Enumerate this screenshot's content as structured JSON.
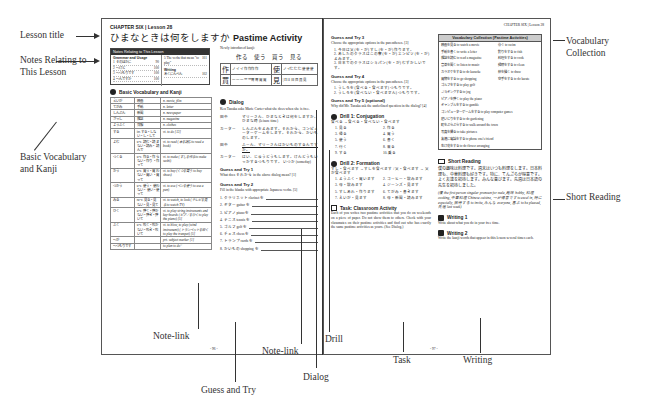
{
  "left_page": {
    "chapter_label": "CHAPTER SIX | Lesson 28",
    "lesson_title_jp": "ひまなときは何をしますか",
    "lesson_title_en": "Pastime Activity",
    "notes_box": {
      "header": "Notes Relating to This Lesson",
      "grammar_heading": "Grammar and Usage",
      "grammar_items": [
        {
          "label": "1 そのほかに",
          "page": "90"
        },
        {
          "label": "2 〜けど",
          "page": "100"
        },
        {
          "label": "3 〜つもりです",
          "page": "100"
        },
        {
          "label": "4 〜んですか",
          "page": "100"
        }
      ],
      "right_items": [
        {
          "label": "5 The verbs that mean \"to play\"",
          "page": "101"
        }
      ],
      "writing_heading": "Writing",
      "writing_items": [
        {
          "label": "あくにんべん",
          "page": "102"
        }
      ]
    },
    "vocab_heading": "Basic Vocabulary and Kanji",
    "vocab_rows": [
      [
        "えいが",
        "映画",
        "n. movie, film"
      ],
      [
        "てがみ",
        "手紙",
        "n. letter"
      ],
      [
        "しんぶん",
        "新聞",
        "n. newspaper"
      ],
      [
        "ざっし",
        "雑誌",
        "n. magazine"
      ],
      [
        "ようふく",
        "洋服",
        "n. clothes"
      ],
      [
        "する",
        "irr. する・しな い・し・して",
        "vt. to do [13]"
      ],
      [
        "よむ",
        "u-v. 読む・読 まない・読み・ 読んで",
        "vt. to read (本を読む to read a book)"
      ],
      [
        "つくる",
        "u-v. 作る・作 らない・作り ・作って",
        "vt. to make (すしを作る to make sushi)"
      ],
      [
        "かう",
        "u-v. 買う・買 わない・買い ・買って",
        "vt. to buy (くつを買う to buy shoes)"
      ],
      [
        "つかう",
        "u-v. 使う・ 使わない・ 使い・使って",
        "vt. to use (ペンを使う to use a pen)"
      ],
      [
        "みる",
        "ru-v. 見る・見 ない・見・見て",
        "vt. to watch, to look (テレビを見る to watch TV)"
      ],
      [
        "ひく",
        "u-v. 弾く・弾か ない・弾き・弾 いて",
        "vt. to play string instruments and key-boards (ピアノをひく to play the piano) [5]"
      ],
      [
        "ふく",
        "u-v. 吹く・吹か ない・吹き・吹 いて",
        "vt. to blow, to play (wind instrument) (トランペットを吹く to play the trumpet) [5]"
      ],
      [
        "〜が",
        "",
        "prt. subject marker [1]"
      ],
      [
        "〜つもりです",
        "",
        "to plan to do~"
      ]
    ],
    "new_kanji_label": "Newly introduced kanji:",
    "new_kanji_line": "作る　使う　買う　見る",
    "kanji_grid": [
      {
        "kanji": "作",
        "strokes": "ノ イ イ 作 作 作 作"
      },
      {
        "kanji": "使",
        "strokes": "ノ イ 仁 仁 仁 使 使 使"
      },
      {
        "kanji": "買",
        "strokes": "一 一 一 罒 罒 胃 胃 買 買"
      },
      {
        "kanji": "見",
        "strokes": "| Π Ħ 日 目 貝 見"
      }
    ],
    "dialog_heading": "Dialog",
    "dialog_intro": "Ken Tanaka asks Marie Carter what she does when she is free.",
    "dialog_lines": [
      {
        "speaker": "田中",
        "text": "マリーさん、ひまなときは何をしますか。 ひまな時 (leisure time)"
      },
      {
        "speaker": "カーター",
        "text": "しんぶんをよみます。それから、コンピューターゲームをします。それから、かいものします。"
      },
      {
        "speaker": "田中",
        "text": "ふーん、マリーさんはかいものするんですか。"
      },
      {
        "speaker": "カーター",
        "text": "はい、じゅうどうもします。けんどうもいっかするつもりです。 いつか (someday)"
      }
    ],
    "guess1_heading": "Guess and Try 1",
    "guess1_text": "What does それから in the above dialog mean? [1]",
    "guess2_heading": "Guess and Try 2",
    "guess2_text": "Fill in the blanks with appropriate Japanese verbs. [5]",
    "guess2_items": [
      "1. クラリネット clarinet を",
      "2. ギター guitar を",
      "3. ピアノ piano を",
      "4. テニス tennis を",
      "5. ゴルフ golf を",
      "6. チェス chess を",
      "7. トランプ cards を",
      "8. かいもの shopping を"
    ],
    "page_number": "- 96 -"
  },
  "right_page": {
    "header": "CHAPTER SIX | Lesson 28",
    "guess3_heading": "Guess and Try 3",
    "guess3_text": "Choose the appropriate options in the parentheses. [3]",
    "guess3_items": [
      "1. 今日は父 (を・が) すし (を・が) 作ります。",
      "2. あしたのクラスはこの寮 (を・が) エンピツ (を・が) よみます。",
      "3. 日本でのクラスはショパン (を・が) むずかしいです。"
    ],
    "guess4_heading": "Guess and Try 4",
    "guess4_text": "Choose the appropriate options in the parentheses. [3]",
    "guess4_items": [
      "1. うしろを (食べる・食べます) つもりです。",
      "2. うしろを (食べない・食べません) つもりです。"
    ],
    "guess5_heading": "Guess and Try 5 (optional)",
    "guess5_text": "Why did Mr. Tanaka ask the underlined question in the dialog? [4]",
    "drill1_heading": "Drill 1: Conjugation",
    "drill1_example": "食べる → 食べる・食べない・食べます",
    "drill1_items": [
      "1. 見る",
      "2. 作る",
      "3. 帰る",
      "4. 買う",
      "5. 使う",
      "6. 書く",
      "7. 行く",
      "8. 来る",
      "9. する",
      "10. 乗る"
    ],
    "drill2_heading": "Drill 2: Formation",
    "drill2_example": "すし・食べます → すしを食べます / 父・食べます → 父が食べます",
    "drill2_items": [
      "1. ようふく・買います",
      "2. コーヒー・飲みます",
      "3. 母・飲みます",
      "4. ジーンズ・見ます",
      "5. すしあれ・作ります",
      "6. てがみ・書きます",
      "7. えいが・見ます",
      "8. 母・新聞・読みます"
    ],
    "task_heading": "Task: Classroom Activity",
    "task_text": "Each of you writes two pastime activities that you do on weekends on a piece of paper. Do not show them to others. Check with your classmates on their pastime activities and find out who has exactly the same pastime activities as yours. (See Dialog.)",
    "vocab_collection_heading": "Vocabulary Collection (Pastime Activities)",
    "vocab_collection_left": [
      "映画を見る to watch a movie",
      "手紙を書く to write a letter",
      "雑誌を読む to read a magazine",
      "音楽を聞く to listen to music",
      "カラオケをする to do karaoke",
      "買物をする to go shopping",
      "ゴルフをする to play golf",
      "ジョギングする to jog",
      "ピアノを弾く to play the piano",
      "ギャンブルをする to gamble",
      "コンピューターゲームをする to play computer games",
      "庭いじりをする to do gardening",
      "町をぶらぶらする to walk around the town",
      "写真を撮る to take pictures",
      "友達に電話をする to phone one's friend",
      "生け花をする to do flower arranging"
    ],
    "vocab_collection_right": [
      "泳ぐ to swim",
      "釣りをする to fish",
      "料理をする to cook",
      "掃除をする to clean",
      "絵を描く to draw",
      "空手をする to do karate"
    ],
    "short_reading_heading": "Short Reading",
    "short_reading_text": "僕の趣味は料理です。週末はいつも料理をします。日本料理も、中華料理も好きです。特に、てんぷらが得意です。よく友達を招待します。みんな喜びます。先週は日本語の先生を招待しました。",
    "short_reading_gloss": "(僕 the first person singular pronoun for male, 趣味 hobby, 料理 cooking, 中華料理 Chinese cuisine, 〜が得意です to excel in, 特に especially, 招待する to invite, みんな everyone, 喜ぶ to be pleased, 先週 last week)",
    "writing1_heading": "Writing 1",
    "writing1_text": "Write about what you do in your free time.",
    "writing2_heading": "Writing 2",
    "writing2_text": "Write the kanji words that appear in this lesson several times each.",
    "page_number": "- 97 -"
  },
  "annotations": {
    "lesson_title": "Lesson title",
    "notes": "Notes Relating to This Lesson",
    "basic_vocab": "Basic Vocabulary and Kanji",
    "note_link_1": "Note-link",
    "guess_and_try": "Guess and Try",
    "note_link_2": "Note-link",
    "dialog": "Dialog",
    "drill": "Drill",
    "task": "Task",
    "writing": "Writing",
    "short_reading": "Short Reading",
    "vocab_collection": "Vocabulary Collection"
  }
}
